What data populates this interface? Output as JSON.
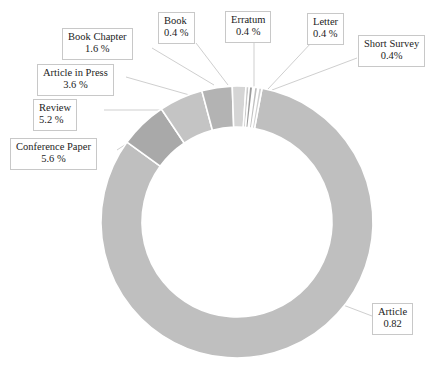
{
  "chart_data": {
    "type": "pie",
    "variant": "donut",
    "title": "",
    "subtitle": "",
    "xlabel": "",
    "ylabel": "",
    "legend_position": "none",
    "grid": false,
    "labels_on_chart": true,
    "categories": [
      "Article",
      "Conference Paper",
      "Review",
      "Article in Press",
      "Book Chapter",
      "Book",
      "Erratum",
      "Letter",
      "Short Survey"
    ],
    "values": [
      82.0,
      5.6,
      5.2,
      3.6,
      1.6,
      0.4,
      0.4,
      0.4,
      0.4
    ],
    "value_labels": [
      "0.82",
      "5.6 %",
      "5.2 %",
      "3.6 %",
      "1.6 %",
      "0.4 %",
      "0.4 %",
      "0.4 %",
      "0.4%"
    ],
    "colors": [
      "#bfbfbf",
      "#a9a9a9",
      "#c4c4c4",
      "#b3b3b3",
      "#d5d5d5",
      "#c9c9c9",
      "#9b9b9b",
      "#c0c0c0",
      "#d0d0d0"
    ],
    "slices": [
      {
        "name": "Article",
        "value_label": "0.82",
        "percent": 82.0,
        "color": "#bfbfbf",
        "start_deg": 10.6,
        "end_deg": 306.0
      },
      {
        "name": "Conference Paper",
        "value_label": "5.6 %",
        "percent": 5.6,
        "color": "#a9a9a9",
        "start_deg": 306.0,
        "end_deg": 326.2
      },
      {
        "name": "Review",
        "value_label": "5.2 %",
        "percent": 5.2,
        "color": "#c4c4c4",
        "start_deg": 326.2,
        "end_deg": 345.0
      },
      {
        "name": "Article in Press",
        "value_label": "3.6 %",
        "percent": 3.6,
        "color": "#b3b3b3",
        "start_deg": 345.0,
        "end_deg": 358.0
      },
      {
        "name": "Book Chapter",
        "value_label": "1.6 %",
        "percent": 1.6,
        "color": "#d5d5d5",
        "start_deg": 358.0,
        "end_deg": 363.8
      },
      {
        "name": "Book",
        "value_label": "0.4 %",
        "percent": 0.4,
        "color": "#c9c9c9",
        "start_deg": 363.8,
        "end_deg": 365.2
      },
      {
        "name": "Erratum",
        "value_label": "0.4 %",
        "percent": 0.4,
        "color": "#9b9b9b",
        "start_deg": 365.2,
        "end_deg": 366.7
      },
      {
        "name": "Letter",
        "value_label": "0.4 %",
        "percent": 0.4,
        "color": "#c0c0c0",
        "start_deg": 367.4,
        "end_deg": 368.8
      },
      {
        "name": "Short Survey",
        "value_label": "0.4%",
        "percent": 0.4,
        "color": "#d0d0d0",
        "start_deg": 369.2,
        "end_deg": 370.6
      }
    ]
  },
  "callouts": {
    "book_chapter": {
      "name": "Book Chapter",
      "value": "1.6 %"
    },
    "book": {
      "name": "Book",
      "value": "0.4 %"
    },
    "erratum": {
      "name": "Erratum",
      "value": "0.4 %"
    },
    "letter": {
      "name": "Letter",
      "value": "0.4 %"
    },
    "short_survey": {
      "name": "Short Survey",
      "value": "0.4%"
    },
    "article_press": {
      "name": "Article in Press",
      "value": "3.6 %"
    },
    "review": {
      "name": "Review",
      "value": "5.2 %"
    },
    "conference": {
      "name": "Conference Paper",
      "value": "5.6 %"
    },
    "article": {
      "name": "Article",
      "value": "0.82"
    }
  },
  "style": {
    "background": "#ffffff",
    "slice_gap_color": "#ffffff",
    "callout_border": "#c8c8c8",
    "text_color": "#1c1c1c",
    "leader_line_color": "#cccccc"
  }
}
